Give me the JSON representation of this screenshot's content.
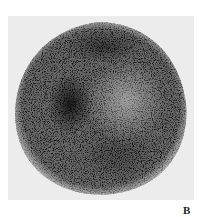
{
  "figure": {
    "panel_label": "B",
    "colors": {
      "background": "#ececec",
      "page": "#ffffff",
      "darkest_counts": "#1a1a1a",
      "label": "#222222"
    }
  }
}
